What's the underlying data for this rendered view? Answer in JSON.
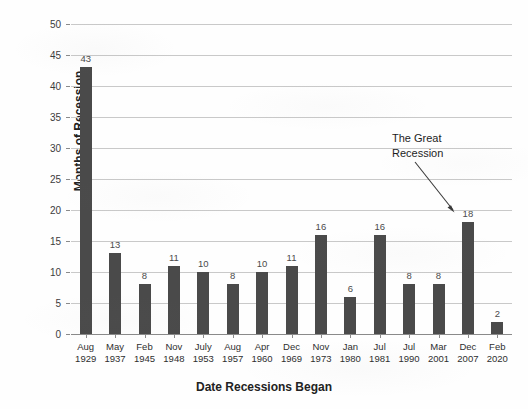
{
  "chart_data": {
    "type": "bar",
    "title": "",
    "xlabel": "Date Recessions Began",
    "ylabel": "Months of Recession",
    "ylim": [
      0,
      50
    ],
    "ytick_step": 5,
    "yticks": [
      "0",
      "5",
      "10",
      "15",
      "20",
      "25",
      "30",
      "35",
      "40",
      "45",
      "50"
    ],
    "grid": true,
    "legend": null,
    "bar_color": "#4a4a4a",
    "gridline_color": "#c9c9c9",
    "categories": [
      "Aug\n1929",
      "May\n1937",
      "Feb\n1945",
      "Nov\n1948",
      "July\n1953",
      "Aug\n1957",
      "Apr\n1960",
      "Dec\n1969",
      "Nov\n1973",
      "Jan\n1980",
      "Jul\n1981",
      "Jul\n1990",
      "Mar\n2001",
      "Dec\n2007",
      "Feb\n2020"
    ],
    "category_months": [
      "Aug",
      "May",
      "Feb",
      "Nov",
      "July",
      "Aug",
      "Apr",
      "Dec",
      "Nov",
      "Jan",
      "Jul",
      "Jul",
      "Mar",
      "Dec",
      "Feb"
    ],
    "category_years": [
      "1929",
      "1937",
      "1945",
      "1948",
      "1953",
      "1957",
      "1960",
      "1969",
      "1973",
      "1980",
      "1981",
      "1990",
      "2001",
      "2007",
      "2020"
    ],
    "values": [
      43,
      13,
      8,
      11,
      10,
      8,
      10,
      11,
      16,
      6,
      16,
      8,
      8,
      18,
      2
    ],
    "data_labels": [
      "43",
      "13",
      "8",
      "11",
      "10",
      "8",
      "10",
      "11",
      "16",
      "6",
      "16",
      "8",
      "8",
      "18",
      "2"
    ],
    "annotations": [
      {
        "text_line1": "The Great",
        "text_line2": "Recession",
        "points_to_category": "Dec\n2007"
      }
    ]
  }
}
